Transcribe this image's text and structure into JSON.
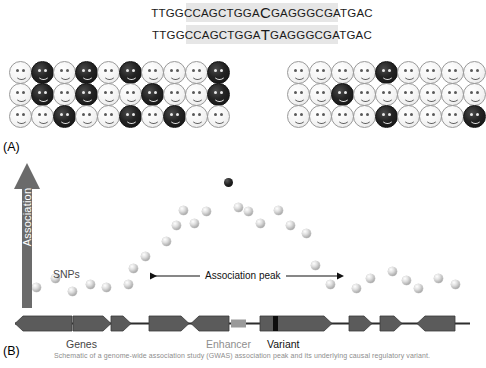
{
  "figure": {
    "panels": [
      {
        "id": "A",
        "label": "(A)"
      },
      {
        "id": "B",
        "label": "(B)"
      }
    ]
  },
  "sequences": [
    {
      "name": "reference-allele-sequence",
      "prefix": "TTGGCCAGCTGGA",
      "allele": "C",
      "suffix": "GAGGGCGATGAC",
      "full": "TTGGCCAGCTGGACGAGGGCGATGAC"
    },
    {
      "name": "alternate-allele-sequence",
      "prefix": "TTGGCCAGCTGGA",
      "allele": "T",
      "suffix": "GAGGGCGATGAC",
      "full": "TTGGCCAGCTGGATGAGGGCGATGAC"
    }
  ],
  "cohorts": {
    "left": {
      "name": "case-cohort",
      "columns": 10,
      "rows": 3,
      "affected_indices": [
        [
          1,
          3,
          5,
          9
        ],
        [
          1,
          3,
          6,
          9
        ],
        [
          2,
          5,
          7
        ]
      ]
    },
    "right": {
      "name": "control-cohort",
      "columns": 9,
      "rows": 3,
      "affected_indices": [
        [
          4
        ],
        [
          2
        ],
        [
          4,
          8
        ]
      ]
    }
  },
  "axis": {
    "label": "Association",
    "direction": "up",
    "color": "#6b6b6b"
  },
  "annotations": {
    "snps": "SNPs",
    "association_peak": "Association peak",
    "genes": "Genes",
    "enhancer": "Enhancer",
    "variant": "Variant"
  },
  "chart_data": {
    "type": "scatter",
    "title": "Association peak",
    "xlabel": "",
    "ylabel": "Association",
    "xlim": [
      0,
      484
    ],
    "ylim": [
      0,
      1
    ],
    "grid": false,
    "legend": "none",
    "series": [
      {
        "name": "SNPs",
        "marker": "grey-sphere",
        "points": [
          {
            "x": 36,
            "y": 0.1
          },
          {
            "x": 55,
            "y": 0.17
          },
          {
            "x": 72,
            "y": 0.07
          },
          {
            "x": 90,
            "y": 0.12
          },
          {
            "x": 106,
            "y": 0.1
          },
          {
            "x": 128,
            "y": 0.12
          },
          {
            "x": 145,
            "y": 0.34
          },
          {
            "x": 166,
            "y": 0.46
          },
          {
            "x": 176,
            "y": 0.58
          },
          {
            "x": 194,
            "y": 0.6
          },
          {
            "x": 183,
            "y": 0.7
          },
          {
            "x": 206,
            "y": 0.69
          },
          {
            "x": 238,
            "y": 0.72
          },
          {
            "x": 248,
            "y": 0.69
          },
          {
            "x": 260,
            "y": 0.6
          },
          {
            "x": 278,
            "y": 0.7
          },
          {
            "x": 290,
            "y": 0.58
          },
          {
            "x": 306,
            "y": 0.52
          },
          {
            "x": 315,
            "y": 0.27
          },
          {
            "x": 330,
            "y": 0.12
          },
          {
            "x": 356,
            "y": 0.09
          },
          {
            "x": 370,
            "y": 0.17
          },
          {
            "x": 392,
            "y": 0.22
          },
          {
            "x": 406,
            "y": 0.15
          },
          {
            "x": 418,
            "y": 0.09
          },
          {
            "x": 438,
            "y": 0.17
          },
          {
            "x": 455,
            "y": 0.12
          },
          {
            "x": 133,
            "y": 0.25
          }
        ]
      },
      {
        "name": "Lead variant",
        "marker": "black-sphere",
        "points": [
          {
            "x": 228,
            "y": 0.92
          }
        ]
      }
    ]
  },
  "gene_track": {
    "baseline_color": "#2d2d2d",
    "gene_fill": "#5b5b5b",
    "features": [
      {
        "name": "gene-1",
        "x": 15,
        "width": 57,
        "strand": "minus",
        "type": "gene"
      },
      {
        "name": "gene-2",
        "x": 73,
        "width": 38,
        "strand": "plus",
        "type": "gene"
      },
      {
        "name": "gene-3",
        "x": 111,
        "width": 20,
        "strand": "plus",
        "type": "gene"
      },
      {
        "name": "gene-4",
        "x": 149,
        "width": 40,
        "strand": "plus",
        "type": "gene"
      },
      {
        "name": "gene-5",
        "x": 191,
        "width": 38,
        "strand": "minus",
        "type": "gene"
      },
      {
        "name": "enhancer-element",
        "x": 231,
        "width": 15,
        "strand": "none",
        "type": "enhancer"
      },
      {
        "name": "gene-6-with-variant",
        "x": 260,
        "width": 72,
        "strand": "plus",
        "type": "gene",
        "variant_offset": 13
      },
      {
        "name": "gene-7",
        "x": 349,
        "width": 23,
        "strand": "plus",
        "type": "gene"
      },
      {
        "name": "gene-8",
        "x": 380,
        "width": 22,
        "strand": "plus",
        "type": "gene"
      },
      {
        "name": "gene-9",
        "x": 417,
        "width": 38,
        "strand": "minus",
        "type": "gene"
      }
    ]
  },
  "caption": "Schematic of a genome-wide association study (GWAS) association peak and its underlying causal regulatory variant."
}
